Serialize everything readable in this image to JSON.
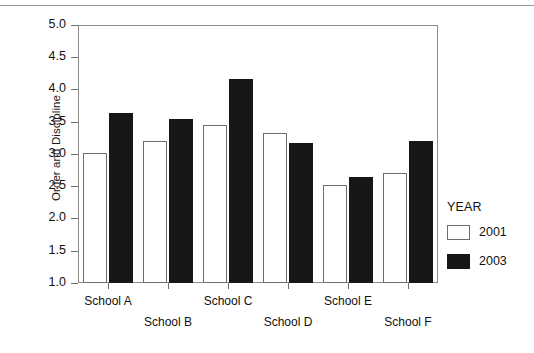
{
  "chart_data": {
    "type": "bar",
    "title": "",
    "xlabel": "",
    "ylabel": "Order and Discipline",
    "ylim": [
      1.0,
      5.0
    ],
    "ytick_labels": [
      "5.0",
      "4.5",
      "4.0",
      "3.5",
      "3.0",
      "2.5",
      "2.0",
      "1.5",
      "1.0"
    ],
    "ytick_values": [
      5.0,
      4.5,
      4.0,
      3.5,
      3.0,
      2.5,
      2.0,
      1.5,
      1.0
    ],
    "grid": false,
    "legend_position": "right",
    "legend_title": "YEAR",
    "categories": [
      "School A",
      "School B",
      "School C",
      "School D",
      "School E",
      "School F"
    ],
    "series": [
      {
        "name": "2001",
        "color": "#ffffff",
        "edge_color": "#6d6d6d",
        "values": [
          3.02,
          3.2,
          3.45,
          3.33,
          2.52,
          2.7
        ]
      },
      {
        "name": "2003",
        "color": "#171717",
        "edge_color": "#171717",
        "values": [
          3.63,
          3.55,
          4.16,
          3.17,
          2.64,
          3.2
        ]
      }
    ]
  },
  "legend": {
    "title": "YEAR",
    "entries": [
      {
        "label": "2001",
        "swatch": "open-square-swatch"
      },
      {
        "label": "2003",
        "swatch": "filled-square-swatch"
      }
    ]
  },
  "axes": {
    "y_title": "Order and Discipline",
    "y_ticks": [
      "5.0",
      "4.5",
      "4.0",
      "3.5",
      "3.0",
      "2.5",
      "2.0",
      "1.5",
      "1.0"
    ],
    "x_categories": [
      "School A",
      "School B",
      "School C",
      "School D",
      "School E",
      "School F"
    ]
  }
}
